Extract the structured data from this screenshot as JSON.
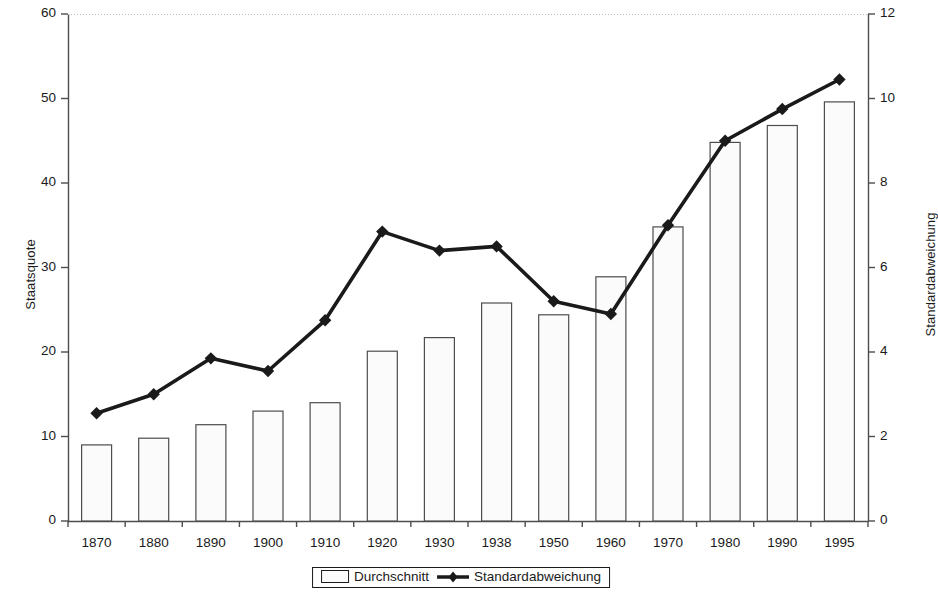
{
  "chart_data": {
    "type": "bar",
    "title": "",
    "xlabel": "",
    "categories": [
      "1870",
      "1880",
      "1890",
      "1900",
      "1910",
      "1920",
      "1930",
      "1938",
      "1950",
      "1960",
      "1970",
      "1980",
      "1990",
      "1995"
    ],
    "series": [
      {
        "name": "Durchschnitt",
        "type": "bar",
        "axis": "left",
        "values": [
          9.0,
          9.8,
          11.4,
          13.0,
          14.0,
          20.1,
          21.7,
          25.8,
          24.4,
          28.9,
          34.8,
          44.8,
          46.8,
          49.6
        ]
      },
      {
        "name": "Standardabweichung",
        "type": "line",
        "axis": "right",
        "values": [
          2.55,
          3.0,
          3.85,
          3.55,
          4.75,
          6.85,
          6.4,
          6.5,
          5.2,
          4.9,
          7.0,
          9.0,
          9.75,
          10.45
        ]
      }
    ],
    "y_left": {
      "label": "Staatsquote",
      "ticks": [
        "0",
        "10",
        "20",
        "30",
        "40",
        "50",
        "60"
      ],
      "min": 0,
      "max": 60
    },
    "y_right": {
      "label": "Standardabweichung",
      "ticks": [
        "0",
        "2",
        "4",
        "6",
        "8",
        "10",
        "12"
      ],
      "min": 0,
      "max": 12
    },
    "grid": "top-only",
    "legend_position": "bottom",
    "colors": {
      "line": "#1a1a1a",
      "bar_fill": "#fbfbfb",
      "bar_stroke": "#4d4d4d",
      "axis": "#4d4d4d"
    }
  },
  "legend": {
    "items": [
      {
        "label": "Durchschnitt",
        "marker": "bar-swatch-icon"
      },
      {
        "label": "Standardabweichung",
        "marker": "line-diamond-icon"
      }
    ]
  }
}
